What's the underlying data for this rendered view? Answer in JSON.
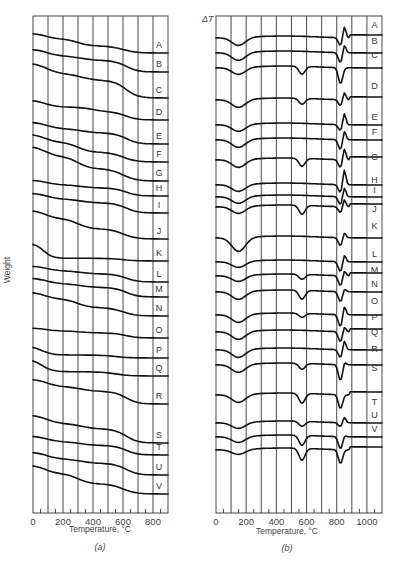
{
  "chart_data": [
    {
      "type": "line",
      "panel": "(a)",
      "title": "",
      "xlabel": "Temperature, °C",
      "ylabel": "Weight",
      "xlim": [
        0,
        900
      ],
      "x_ticks": [
        0,
        200,
        400,
        600,
        800
      ],
      "grid": true,
      "series": [
        {
          "name": "A"
        },
        {
          "name": "B"
        },
        {
          "name": "C"
        },
        {
          "name": "D"
        },
        {
          "name": "E"
        },
        {
          "name": "F"
        },
        {
          "name": "G"
        },
        {
          "name": "H"
        },
        {
          "name": "I"
        },
        {
          "name": "J"
        },
        {
          "name": "K"
        },
        {
          "name": "L"
        },
        {
          "name": "M"
        },
        {
          "name": "N"
        },
        {
          "name": "O"
        },
        {
          "name": "P"
        },
        {
          "name": "Q"
        },
        {
          "name": "R"
        },
        {
          "name": "S"
        },
        {
          "name": "T"
        },
        {
          "name": "U"
        },
        {
          "name": "V"
        }
      ]
    },
    {
      "type": "line",
      "panel": "(b)",
      "title": "",
      "xlabel": "Temperature, °C",
      "ylabel": "ΔT",
      "xlim": [
        0,
        1100
      ],
      "x_ticks": [
        0,
        200,
        400,
        600,
        800,
        1000
      ],
      "grid": true,
      "series": [
        {
          "name": "A"
        },
        {
          "name": "B"
        },
        {
          "name": "C"
        },
        {
          "name": "D"
        },
        {
          "name": "E"
        },
        {
          "name": "F"
        },
        {
          "name": "G"
        },
        {
          "name": "H"
        },
        {
          "name": "I"
        },
        {
          "name": "J"
        },
        {
          "name": "K"
        },
        {
          "name": "L"
        },
        {
          "name": "M"
        },
        {
          "name": "N"
        },
        {
          "name": "O"
        },
        {
          "name": "P"
        },
        {
          "name": "Q"
        },
        {
          "name": "R"
        },
        {
          "name": "S"
        },
        {
          "name": "T"
        },
        {
          "name": "U"
        },
        {
          "name": "V"
        }
      ]
    }
  ],
  "panel_a": {
    "ylabel": "Weight",
    "xlabel": "Temperature, °C",
    "caption": "(a)",
    "ticks": [
      "0",
      "200",
      "400",
      "600",
      "800"
    ]
  },
  "panel_b": {
    "ylabel": "ΔT",
    "xlabel": "Temperature, °C",
    "caption": "(b)",
    "ticks": [
      "0",
      "200",
      "400",
      "600",
      "800",
      "1000"
    ]
  },
  "labels": [
    "A",
    "B",
    "C",
    "D",
    "E",
    "F",
    "G",
    "H",
    "I",
    "J",
    "K",
    "L",
    "M",
    "N",
    "O",
    "P",
    "Q",
    "R",
    "S",
    "T",
    "U",
    "V"
  ]
}
